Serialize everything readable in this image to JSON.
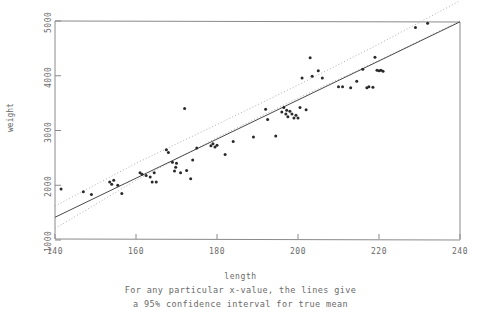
{
  "chart_data": {
    "type": "scatter",
    "title": "",
    "xlabel": "length",
    "ylabel": "weight",
    "xlim": [
      140,
      240
    ],
    "ylim": [
      1000,
      5000
    ],
    "xticks": [
      140,
      160,
      180,
      200,
      220,
      240
    ],
    "yticks": [
      1000,
      2000,
      3000,
      4000,
      5000
    ],
    "grid": false,
    "legend": null,
    "annotations": [
      "For any particular x-value, the lines give",
      "a 95% confidence interval for true mean"
    ],
    "marker_color": "#2a2a2a",
    "line_color": "#4a4a4a",
    "band_color": "#b0b0b0",
    "frame_color": "#8a8a8a",
    "regression_line": {
      "style": "solid",
      "x": [
        140,
        240
      ],
      "y": [
        1415,
        4985
      ]
    },
    "confidence_band": {
      "level": "95%",
      "style": "dotted",
      "upper": {
        "x": [
          140,
          160,
          180,
          200,
          220,
          240
        ],
        "y": [
          1620,
          2400,
          3110,
          3830,
          4580,
          5370
        ]
      },
      "lower": {
        "x": [
          140,
          160,
          180,
          200,
          220,
          240
        ],
        "y": [
          1210,
          2090,
          2870,
          3590,
          4280,
          5000
        ]
      }
    },
    "points": [
      {
        "x": 141.5,
        "y": 1930
      },
      {
        "x": 147.0,
        "y": 1880
      },
      {
        "x": 149.0,
        "y": 1830
      },
      {
        "x": 153.5,
        "y": 2060
      },
      {
        "x": 154.0,
        "y": 2020
      },
      {
        "x": 154.5,
        "y": 2090
      },
      {
        "x": 155.5,
        "y": 2000
      },
      {
        "x": 156.5,
        "y": 1850
      },
      {
        "x": 161.0,
        "y": 2230
      },
      {
        "x": 161.5,
        "y": 2200
      },
      {
        "x": 162.5,
        "y": 2180
      },
      {
        "x": 163.5,
        "y": 2150
      },
      {
        "x": 164.0,
        "y": 2060
      },
      {
        "x": 164.5,
        "y": 2230
      },
      {
        "x": 165.0,
        "y": 2060
      },
      {
        "x": 167.5,
        "y": 2650
      },
      {
        "x": 168.0,
        "y": 2600
      },
      {
        "x": 169.0,
        "y": 2420
      },
      {
        "x": 169.5,
        "y": 2260
      },
      {
        "x": 169.8,
        "y": 2330
      },
      {
        "x": 170.0,
        "y": 2400
      },
      {
        "x": 171.0,
        "y": 2230
      },
      {
        "x": 172.0,
        "y": 3400
      },
      {
        "x": 172.5,
        "y": 2270
      },
      {
        "x": 173.5,
        "y": 2120
      },
      {
        "x": 174.0,
        "y": 2460
      },
      {
        "x": 175.0,
        "y": 2680
      },
      {
        "x": 178.5,
        "y": 2720
      },
      {
        "x": 179.0,
        "y": 2760
      },
      {
        "x": 179.5,
        "y": 2700
      },
      {
        "x": 180.0,
        "y": 2730
      },
      {
        "x": 182.0,
        "y": 2560
      },
      {
        "x": 184.0,
        "y": 2800
      },
      {
        "x": 189.0,
        "y": 2880
      },
      {
        "x": 192.0,
        "y": 3390
      },
      {
        "x": 192.5,
        "y": 3200
      },
      {
        "x": 194.5,
        "y": 2900
      },
      {
        "x": 196.0,
        "y": 3340
      },
      {
        "x": 196.5,
        "y": 3420
      },
      {
        "x": 197.0,
        "y": 3300
      },
      {
        "x": 197.2,
        "y": 3370
      },
      {
        "x": 197.5,
        "y": 3250
      },
      {
        "x": 198.0,
        "y": 3350
      },
      {
        "x": 198.5,
        "y": 3300
      },
      {
        "x": 199.0,
        "y": 3230
      },
      {
        "x": 199.5,
        "y": 3280
      },
      {
        "x": 200.0,
        "y": 3230
      },
      {
        "x": 200.5,
        "y": 3420
      },
      {
        "x": 201.0,
        "y": 3960
      },
      {
        "x": 202.0,
        "y": 3380
      },
      {
        "x": 203.0,
        "y": 4330
      },
      {
        "x": 203.5,
        "y": 3990
      },
      {
        "x": 205.0,
        "y": 4090
      },
      {
        "x": 206.0,
        "y": 3960
      },
      {
        "x": 210.0,
        "y": 3800
      },
      {
        "x": 211.0,
        "y": 3800
      },
      {
        "x": 213.0,
        "y": 3780
      },
      {
        "x": 214.5,
        "y": 3900
      },
      {
        "x": 216.0,
        "y": 4120
      },
      {
        "x": 217.0,
        "y": 3780
      },
      {
        "x": 217.5,
        "y": 3800
      },
      {
        "x": 218.5,
        "y": 3790
      },
      {
        "x": 219.0,
        "y": 4340
      },
      {
        "x": 219.5,
        "y": 4100
      },
      {
        "x": 220.0,
        "y": 4090
      },
      {
        "x": 220.5,
        "y": 4100
      },
      {
        "x": 221.0,
        "y": 4080
      },
      {
        "x": 229.0,
        "y": 4880
      },
      {
        "x": 232.0,
        "y": 4960
      }
    ]
  }
}
